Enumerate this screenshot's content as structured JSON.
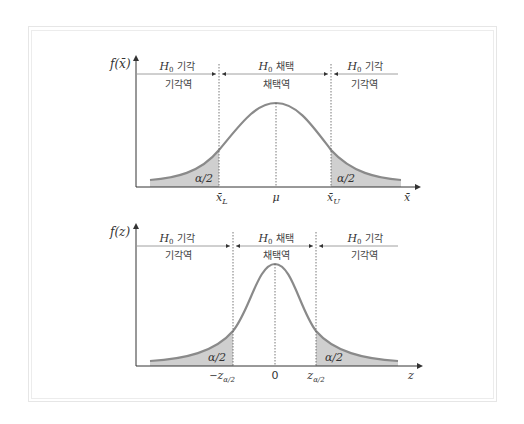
{
  "colors": {
    "curve": "#8a8a8a",
    "tail_fill": "#cfcfcf",
    "axis": "#333333",
    "frame": "#e6e6e6"
  },
  "top_plot": {
    "y_axis_label": "f(x̄)",
    "x_axis_label": "x̄",
    "regions": {
      "left": {
        "title_var": "H",
        "title_sub": "0",
        "title_text": "기각",
        "subtitle": "기각역"
      },
      "middle": {
        "title_var": "H",
        "title_sub": "0",
        "title_text": "채택",
        "subtitle": "채택역"
      },
      "right": {
        "title_var": "H",
        "title_sub": "0",
        "title_text": "기각",
        "subtitle": "기각역"
      }
    },
    "tail_left_label": "α/2",
    "tail_right_label": "α/2",
    "ticks": {
      "lower": {
        "var": "x̄",
        "sub": "L"
      },
      "center": "μ",
      "upper": {
        "var": "x̄",
        "sub": "U"
      }
    }
  },
  "bottom_plot": {
    "y_axis_label": "f(z)",
    "x_axis_label": "z",
    "regions": {
      "left": {
        "title_var": "H",
        "title_sub": "0",
        "title_text": "기각",
        "subtitle": "기각역"
      },
      "middle": {
        "title_var": "H",
        "title_sub": "0",
        "title_text": "채택",
        "subtitle": "채택역"
      },
      "right": {
        "title_var": "H",
        "title_sub": "0",
        "title_text": "기각",
        "subtitle": "기각역"
      }
    },
    "tail_left_label": "α/2",
    "tail_right_label": "α/2",
    "ticks": {
      "lower": {
        "prefix": "−",
        "var": "z",
        "sub": "α/2"
      },
      "center": "0",
      "upper": {
        "var": "z",
        "sub": "α/2"
      }
    }
  }
}
